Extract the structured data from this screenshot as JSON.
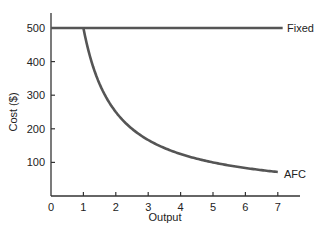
{
  "chart_data": {
    "type": "line",
    "title": "",
    "xlabel": "Output",
    "ylabel": "Cost ($)",
    "xlim": [
      0,
      7.5
    ],
    "ylim": [
      0,
      550
    ],
    "x_ticks": [
      "0",
      "1",
      "2",
      "3",
      "4",
      "5",
      "6",
      "7"
    ],
    "y_ticks": [
      "100",
      "200",
      "300",
      "400",
      "500"
    ],
    "grid": false,
    "legend": "none (inline curve labels)",
    "series": [
      {
        "name": "Fixed cost",
        "label_position": "right end of line",
        "x": [
          0,
          1,
          2,
          3,
          4,
          5,
          6,
          7
        ],
        "values": [
          500,
          500,
          500,
          500,
          500,
          500,
          500,
          500
        ]
      },
      {
        "name": "AFC",
        "label_position": "right end of curve",
        "x": [
          1,
          1.5,
          2,
          2.5,
          3,
          4,
          5,
          6,
          7
        ],
        "values": [
          500,
          333,
          250,
          200,
          167,
          125,
          100,
          83,
          71
        ]
      }
    ]
  },
  "labels": {
    "xlabel": "Output",
    "ylabel": "Cost ($)",
    "fixed_cost": "Fixed cost",
    "afc": "AFC"
  }
}
